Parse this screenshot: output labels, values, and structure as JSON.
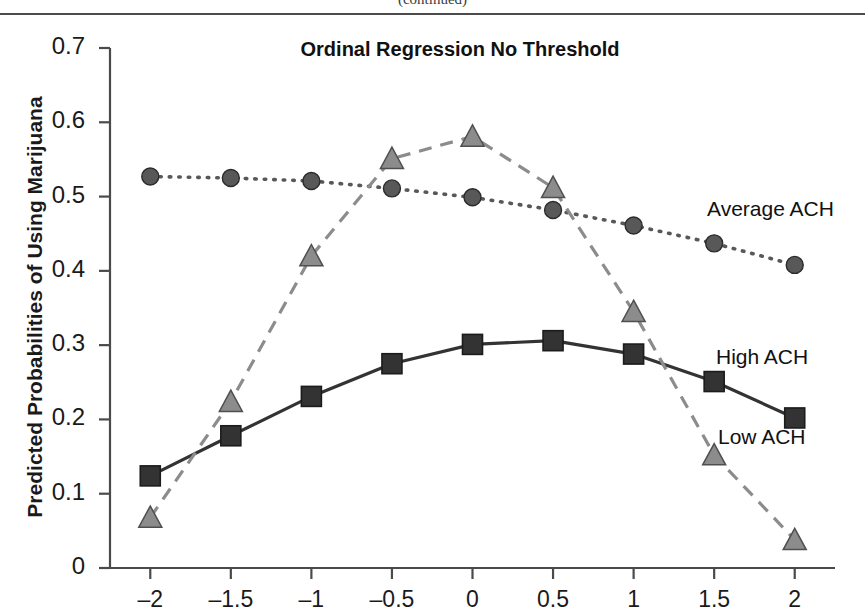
{
  "page": {
    "clipped_header_fragment": "(continued)"
  },
  "chart_data": {
    "type": "line",
    "title": "Ordinal Regression No Threshold",
    "xlabel": "",
    "ylabel": "Predicted Probabilities of Using Marijuana",
    "x": [
      -2,
      -1.5,
      -1,
      -0.5,
      0,
      0.5,
      1,
      1.5,
      2
    ],
    "xtick_labels": [
      "–2",
      "–1.5",
      "–1",
      "–0.5",
      "0",
      "0.5",
      "1",
      "1.5",
      "2"
    ],
    "ytick_labels": [
      "0.7",
      "0.6",
      "0.5",
      "0.4",
      "0.3",
      "0.2",
      "0.1",
      "0"
    ],
    "yticks": [
      0.7,
      0.6,
      0.5,
      0.4,
      0.3,
      0.2,
      0.1,
      0
    ],
    "xlim": [
      -2.25,
      2.25
    ],
    "ylim": [
      0,
      0.7
    ],
    "grid": false,
    "legend_position": "inline-right",
    "series": [
      {
        "name": "Average ACH",
        "marker": "circle",
        "line_style": "dotted",
        "color": "#585858",
        "values": [
          0.527,
          0.525,
          0.521,
          0.511,
          0.499,
          0.482,
          0.461,
          0.437,
          0.408
        ]
      },
      {
        "name": "High ACH",
        "marker": "square",
        "line_style": "solid",
        "color": "#333333",
        "values": [
          0.124,
          0.178,
          0.231,
          0.275,
          0.301,
          0.306,
          0.288,
          0.251,
          0.202
        ]
      },
      {
        "name": "Low ACH",
        "marker": "triangle",
        "line_style": "dashed",
        "color": "#8c8c8c",
        "values": [
          0.068,
          0.224,
          0.42,
          0.551,
          0.581,
          0.512,
          0.345,
          0.152,
          0.038
        ]
      }
    ]
  },
  "axis": {
    "axis_color": "#4a4a4a"
  }
}
